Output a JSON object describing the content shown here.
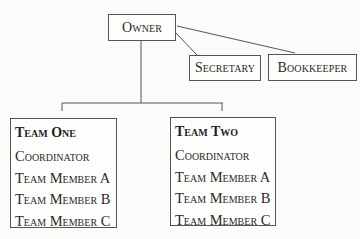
{
  "chart": {
    "type": "org-chart",
    "owner": {
      "label": "Owner"
    },
    "staff": [
      {
        "label": "Secretary"
      },
      {
        "label": "Bookkeeper"
      }
    ],
    "teams": [
      {
        "title": "Team One",
        "members": [
          "Coordinator",
          "Team Member A",
          "Team Member B",
          "Team Member C"
        ]
      },
      {
        "title": "Team Two",
        "members": [
          "Coordinator",
          "Team Member A",
          "Team Member B",
          "Team Member C"
        ]
      }
    ]
  },
  "colors": {
    "line": "#555555",
    "text": "#2a2a2a",
    "background": "#fbfbf9"
  }
}
